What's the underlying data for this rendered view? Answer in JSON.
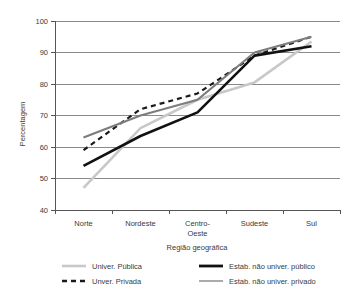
{
  "chart_data": {
    "type": "line",
    "title": "",
    "xlabel": "Região geográfica",
    "ylabel": "Percentagem",
    "categories": [
      "Norte",
      "Nordeste",
      "Centro-\nOeste",
      "Sudeste",
      "Sul"
    ],
    "category_labels": [
      {
        "line1": "Norte",
        "line2": ""
      },
      {
        "line1": "Nordeste",
        "line2": ""
      },
      {
        "line1": "Centro-",
        "line2": "Oeste"
      },
      {
        "line1": "Sudeste",
        "line2": ""
      },
      {
        "line1": "Sul",
        "line2": ""
      }
    ],
    "ylim": [
      40,
      100
    ],
    "yticks": [
      40,
      50,
      60,
      70,
      80,
      90,
      100
    ],
    "ytick_labels": [
      "40",
      "50",
      "60",
      "70",
      "80",
      "90",
      "100"
    ],
    "grid": true,
    "legend_position": "bottom",
    "series": [
      {
        "name": "Univer. Pública",
        "color": "#c8c8c8",
        "width": 2.6,
        "dash": "none",
        "values": [
          47,
          66,
          75,
          80.5,
          93.5
        ]
      },
      {
        "name": "Unver. Privada",
        "color": "#1a1a1a",
        "width": 2.2,
        "dash": "5,4",
        "values": [
          59,
          72,
          77,
          89,
          95
        ]
      },
      {
        "name": "Estab. não univer. público",
        "color": "#111111",
        "width": 2.6,
        "dash": "none",
        "values": [
          54,
          63.5,
          71,
          89,
          92
        ]
      },
      {
        "name": "Estab. não univer. privado",
        "color": "#7d7d7d",
        "width": 2.2,
        "dash": "none",
        "values": [
          63,
          70,
          75,
          90,
          95
        ]
      }
    ]
  },
  "legend": {
    "entries": [
      {
        "label": "Univer. Pública",
        "color": "#c8c8c8",
        "dash": "none",
        "width": 2.6
      },
      {
        "label": "Unver. Privada",
        "color": "#1a1a1a",
        "dash": "5,4",
        "width": 2.4
      },
      {
        "label": "Estab. não univer. público",
        "color": "#111111",
        "dash": "none",
        "width": 2.8
      },
      {
        "label": "Estab. não univer. privado",
        "color": "#7d7d7d",
        "dash": "none",
        "width": 1.3
      }
    ]
  },
  "colors": {
    "axis": "#555555",
    "grid": "#8a8a8a",
    "background": "#ffffff",
    "text": "#3a3a3a"
  }
}
